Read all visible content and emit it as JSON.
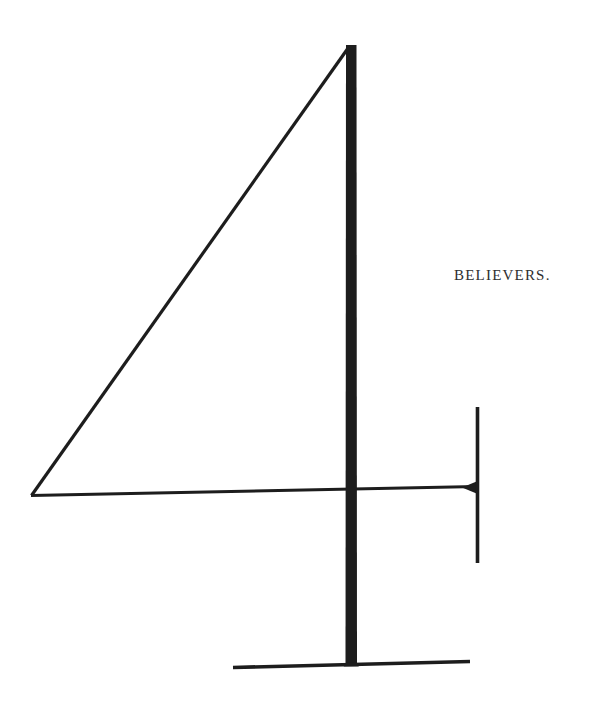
{
  "page": {
    "running_head": "BELIEVERS.",
    "figure": {
      "glyph": "4",
      "name": "numeral-4-figure"
    },
    "colors": {
      "ink": "#1d1d1d",
      "hairline_ink": "#242424",
      "text_ink": "#2e2e2e",
      "paper": "#ffffff"
    }
  }
}
